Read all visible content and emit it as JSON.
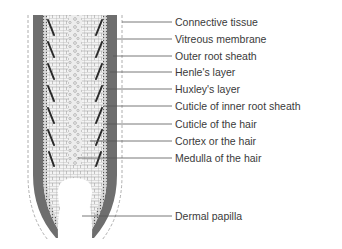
{
  "diagram": {
    "type": "anatomical-cross-section",
    "colors": {
      "outer_sheath": "#6e6e6e",
      "vitreous": "#8a8a8a",
      "cell_fill": "#f2f2f2",
      "cell_stroke": "#9a9a9a",
      "dark_streaks": "#2a2a2a",
      "leader_line": "#555555",
      "text": "#3a3a3a",
      "dashed": "#9a9a9a"
    },
    "labels": [
      {
        "text": "Connective tissue",
        "y": 22,
        "line_start_x": 122
      },
      {
        "text": "Vitreous membrane",
        "y": 39,
        "line_start_x": 117
      },
      {
        "text": "Outer root sheath",
        "y": 56,
        "line_start_x": 113
      },
      {
        "text": "Henle's layer",
        "y": 72,
        "line_start_x": 110
      },
      {
        "text": "Huxley's layer",
        "y": 89,
        "line_start_x": 106
      },
      {
        "text": "Cuticle of inner root sheath",
        "y": 106,
        "line_start_x": 104
      },
      {
        "text": "Cuticle of the hair",
        "y": 124,
        "line_start_x": 104
      },
      {
        "text": "Cortex or the hair",
        "y": 141,
        "line_start_x": 90
      },
      {
        "text": "Medulla of the hair",
        "y": 158,
        "line_start_x": 78
      },
      {
        "text": "Dermal papilla",
        "y": 216,
        "line_start_x": 82
      }
    ]
  }
}
